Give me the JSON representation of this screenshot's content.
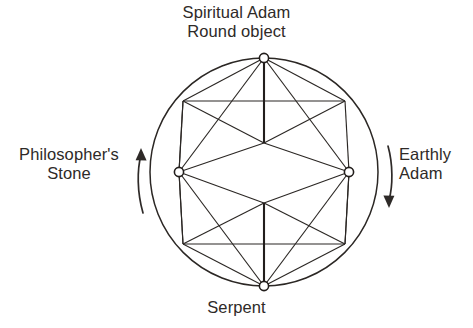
{
  "figure": {
    "title_top": "Spiritual Adam\nRound object",
    "label_bottom": "Serpent",
    "label_left": "Philosopher's\nStone",
    "label_right": "Earthly\nAdam",
    "background_color": "#ffffff",
    "ink_color": "#2b2724",
    "text_color": "#2e2a28"
  },
  "annotations": {
    "left_arrow_direction": "up",
    "right_arrow_direction": "down",
    "left_arrow_name": "ascent-arrow",
    "right_arrow_name": "descent-arrow"
  },
  "diagram": {
    "shape": "circle-with-inscribed-hexagram-lattice",
    "circle": {
      "cx": 264,
      "cy": 172,
      "r": 114
    },
    "nodes": [
      {
        "id": "top",
        "label": "Spiritual Adam / Round object",
        "x": 264,
        "y": 58,
        "marker": true
      },
      {
        "id": "upper-left",
        "label": "",
        "x": 183,
        "y": 101,
        "marker": false
      },
      {
        "id": "upper-right",
        "label": "",
        "x": 345,
        "y": 101,
        "marker": false
      },
      {
        "id": "left",
        "label": "Philosopher's Stone",
        "x": 179,
        "y": 172,
        "marker": true
      },
      {
        "id": "right",
        "label": "Earthly Adam",
        "x": 349,
        "y": 172,
        "marker": true
      },
      {
        "id": "lower-left",
        "label": "",
        "x": 183,
        "y": 244,
        "marker": false
      },
      {
        "id": "lower-right",
        "label": "",
        "x": 345,
        "y": 244,
        "marker": false
      },
      {
        "id": "bottom",
        "label": "Serpent",
        "x": 264,
        "y": 286,
        "marker": true
      },
      {
        "id": "upper-mid",
        "label": "",
        "x": 264,
        "y": 143,
        "marker": false
      },
      {
        "id": "lower-mid",
        "label": "",
        "x": 264,
        "y": 203,
        "marker": false
      }
    ],
    "edges": [
      {
        "from": "top",
        "to": "upper-left"
      },
      {
        "from": "top",
        "to": "upper-right"
      },
      {
        "from": "top",
        "to": "upper-mid",
        "weight": "thick"
      },
      {
        "from": "top",
        "to": "left"
      },
      {
        "from": "top",
        "to": "right"
      },
      {
        "from": "upper-left",
        "to": "upper-right"
      },
      {
        "from": "upper-left",
        "to": "left"
      },
      {
        "from": "upper-right",
        "to": "right"
      },
      {
        "from": "upper-left",
        "to": "upper-mid"
      },
      {
        "from": "upper-right",
        "to": "upper-mid"
      },
      {
        "from": "left",
        "to": "upper-mid"
      },
      {
        "from": "right",
        "to": "upper-mid"
      },
      {
        "from": "left",
        "to": "lower-mid"
      },
      {
        "from": "right",
        "to": "lower-mid"
      },
      {
        "from": "upper-mid",
        "to": "lower-mid",
        "weight": "hidden"
      },
      {
        "from": "left",
        "to": "lower-left"
      },
      {
        "from": "right",
        "to": "lower-right"
      },
      {
        "from": "lower-left",
        "to": "lower-right"
      },
      {
        "from": "lower-left",
        "to": "lower-mid"
      },
      {
        "from": "lower-right",
        "to": "lower-mid"
      },
      {
        "from": "bottom",
        "to": "lower-mid",
        "weight": "thick"
      },
      {
        "from": "bottom",
        "to": "lower-left"
      },
      {
        "from": "bottom",
        "to": "lower-right"
      },
      {
        "from": "bottom",
        "to": "left"
      },
      {
        "from": "bottom",
        "to": "right"
      }
    ]
  }
}
